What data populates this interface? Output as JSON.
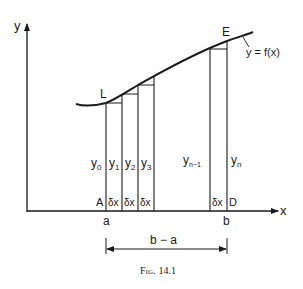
{
  "figure": {
    "caption": "Fig. 14.1",
    "caption_prefix": "Fig.",
    "caption_number": "14.1"
  },
  "axes": {
    "y_label": "y",
    "x_label": "x"
  },
  "curve": {
    "label": "y = f(x)",
    "start_point_label": "L",
    "end_point_label": "E"
  },
  "ordinates": {
    "labels": [
      "y0",
      "y1",
      "y2",
      "y3",
      "yn-1",
      "yn"
    ],
    "y0": {
      "base": "y",
      "sub": "0"
    },
    "y1": {
      "base": "y",
      "sub": "1"
    },
    "y2": {
      "base": "y",
      "sub": "2"
    },
    "y3": {
      "base": "y",
      "sub": "3"
    },
    "yn_1": {
      "base": "y",
      "sub": "n−1"
    },
    "yn": {
      "base": "y",
      "sub": "n"
    }
  },
  "strips": {
    "width_label": "δx",
    "labels": [
      "δx",
      "δx",
      "δx",
      "δx"
    ]
  },
  "points": {
    "A": "A",
    "D": "D",
    "a": "a",
    "b": "b"
  },
  "interval": {
    "label": "b − a"
  },
  "colors": {
    "ink": "#1a1a1a",
    "background": "#ffffff"
  }
}
